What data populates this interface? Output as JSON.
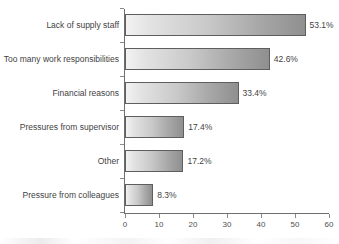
{
  "chart_data": {
    "type": "bar",
    "orientation": "horizontal",
    "title": "",
    "xlabel": "",
    "ylabel": "",
    "xlim": [
      0,
      60
    ],
    "xticks": [
      0,
      10,
      20,
      30,
      40,
      50,
      60
    ],
    "grid": false,
    "legend": null,
    "value_suffix": "%",
    "categories": [
      "Lack of supply staff",
      "Too many work responsibilities",
      "Financial reasons",
      "Pressures from supervisor",
      "Other",
      "Pressure from colleagues"
    ],
    "values": [
      53.1,
      42.6,
      33.4,
      17.4,
      17.2,
      8.3
    ],
    "value_labels": [
      "53.1%",
      "42.6%",
      "33.4%",
      "17.4%",
      "17.2%",
      "8.3%"
    ],
    "colors": {
      "bar_gradient_start": "#f2f2f2",
      "bar_gradient_end": "#8f8f8f",
      "bar_border": "#5e5e5e",
      "axis": "#6f6f6f",
      "text": "#3f3f3f",
      "background": "#ffffff"
    }
  }
}
